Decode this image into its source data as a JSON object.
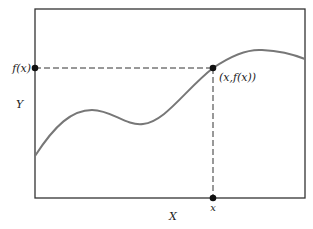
{
  "diagram": {
    "type": "function-graph",
    "labels": {
      "fx_axis_label": "f(x)",
      "point_label": "(x,f(x))",
      "x_axis_label": "X",
      "y_axis_label": "Y",
      "x_tick_label": "x"
    },
    "colors": {
      "frame": "#333333",
      "curve": "#777777",
      "guide": "#333333",
      "point": "#111111"
    },
    "frame": {
      "left": 35,
      "top": 9,
      "right": 305,
      "bottom": 198
    },
    "point": {
      "x": 213,
      "y": 68
    },
    "curve_path": "M35,156 C55,125 72,110 92,110 C112,110 125,126 143,124 C165,122 185,90 213,68 C232,55 248,49 262,50 C282,51 295,55 305,59"
  }
}
